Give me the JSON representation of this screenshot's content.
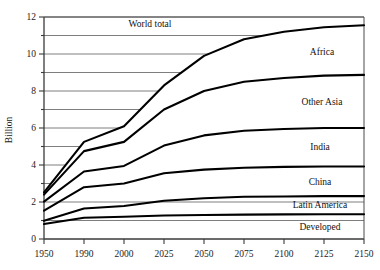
{
  "chart_data": {
    "type": "line",
    "title": "",
    "xlabel": "",
    "ylabel": "Billion",
    "xlim": [
      1950,
      2150
    ],
    "ylim": [
      0,
      12
    ],
    "grid": true,
    "legend_position": "inline-right",
    "x_tick_labels": [
      "1950",
      "1990",
      "2000",
      "2025",
      "2050",
      "2075",
      "2100",
      "2125",
      "2150"
    ],
    "x_tick_values": [
      1950,
      1990,
      2000,
      2025,
      2050,
      2075,
      2100,
      2125,
      2150
    ],
    "y_tick_labels": [
      "0",
      "2",
      "4",
      "6",
      "8",
      "10",
      "12"
    ],
    "y_tick_values": [
      0,
      2,
      4,
      6,
      8,
      10,
      12
    ],
    "y_minor_ticks": [
      1,
      3,
      5,
      7,
      9,
      11
    ],
    "gridline_values": [
      1,
      2,
      3,
      4,
      5,
      6,
      7,
      8,
      9,
      10,
      11,
      12
    ],
    "note": "Cumulative stacked population projection curves; each curve is a running total, top curve is World total.",
    "series": [
      {
        "name": "Developed",
        "label": "Developed",
        "values": [
          0.81,
          1.15,
          1.2,
          1.27,
          1.3,
          1.32,
          1.33,
          1.34,
          1.34
        ]
      },
      {
        "name": "Latin America",
        "label": "Latin America",
        "values": [
          0.98,
          1.65,
          1.78,
          2.07,
          2.2,
          2.28,
          2.3,
          2.32,
          2.32
        ]
      },
      {
        "name": "China",
        "label": "China",
        "values": [
          1.53,
          2.8,
          3.0,
          3.55,
          3.75,
          3.85,
          3.9,
          3.92,
          3.92
        ]
      },
      {
        "name": "India",
        "label": "India",
        "values": [
          2.02,
          3.65,
          3.95,
          5.05,
          5.6,
          5.85,
          5.95,
          6.0,
          6.0
        ]
      },
      {
        "name": "Other Asia",
        "label": "Other Asia",
        "values": [
          2.4,
          4.75,
          5.25,
          7.0,
          8.0,
          8.5,
          8.7,
          8.83,
          8.87
        ]
      },
      {
        "name": "Africa",
        "label": "Africa",
        "values": [
          2.52,
          5.25,
          6.1,
          8.3,
          9.9,
          10.8,
          11.2,
          11.45,
          11.55
        ]
      }
    ],
    "world_total_label": "World total"
  }
}
